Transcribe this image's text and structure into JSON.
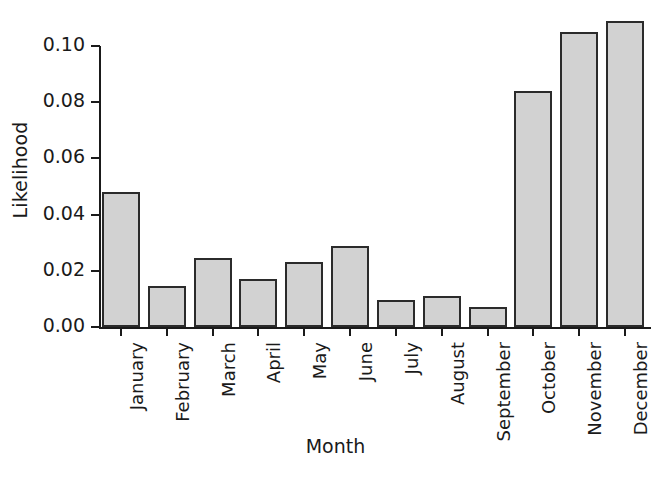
{
  "chart_data": {
    "type": "bar",
    "title": "",
    "xlabel": "Month",
    "ylabel": "Likelihood",
    "categories": [
      "January",
      "February",
      "March",
      "April",
      "May",
      "June",
      "July",
      "August",
      "September",
      "October",
      "November",
      "December"
    ],
    "values": [
      0.048,
      0.0145,
      0.0245,
      0.017,
      0.023,
      0.029,
      0.0095,
      0.011,
      0.007,
      0.084,
      0.105,
      0.109
    ],
    "ylim": [
      0.0,
      0.1
    ],
    "ytick_values": [
      0.0,
      0.02,
      0.04,
      0.06,
      0.08,
      0.1
    ],
    "ytick_labels": [
      "0.00",
      "0.02",
      "0.04",
      "0.06",
      "0.08",
      "0.10"
    ],
    "grid": false,
    "legend": false,
    "legend_position": "none",
    "bar_fill_color": "#d2d2d2",
    "bar_edge_color": "#2b2b2b",
    "axis_color": "#1a1a1a",
    "background_color": "#ffffff",
    "xtick_label_rotation": 90
  }
}
